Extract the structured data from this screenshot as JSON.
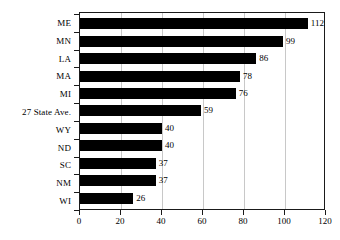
{
  "chart_data": {
    "type": "bar",
    "orientation": "horizontal",
    "title": "",
    "xlabel": "",
    "ylabel": "",
    "xlim": [
      0,
      120
    ],
    "xticks": [
      0,
      20,
      40,
      60,
      80,
      100,
      120
    ],
    "xtick_labels": [
      "0",
      "20",
      "40",
      "60",
      "80",
      "100",
      "120"
    ],
    "grid": true,
    "grid_axis": "x",
    "legend": false,
    "bar_color": "#000000",
    "grid_color": "#c8c8c8",
    "axis_color": "#1a1a1a",
    "show_value_labels": true,
    "categories": [
      "ME",
      "MN",
      "LA",
      "MA",
      "MI",
      "27 State Ave.",
      "WY",
      "ND",
      "SC",
      "NM",
      "WI"
    ],
    "values": [
      112,
      99,
      86,
      78,
      76,
      59,
      40,
      40,
      37,
      37,
      26
    ],
    "value_labels": [
      "112",
      "99",
      "86",
      "78",
      "76",
      "59",
      "40",
      "40",
      "37",
      "37",
      "26"
    ]
  }
}
